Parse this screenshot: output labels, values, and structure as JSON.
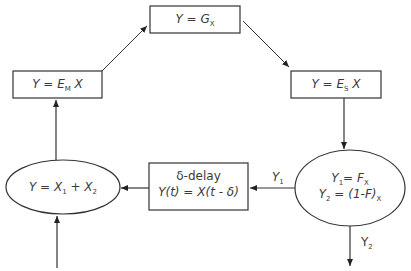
{
  "diagram": {
    "nodes": {
      "top_box": {
        "shape": "rectangle",
        "label": "Y = G",
        "sub": "X"
      },
      "left_box": {
        "shape": "rectangle",
        "label": "Y = E",
        "sub": "M",
        "suffix": " X"
      },
      "right_box": {
        "shape": "rectangle",
        "label": "Y = E",
        "sub": "S",
        "suffix": " X"
      },
      "split_ellipse": {
        "shape": "ellipse",
        "line1": "Y",
        "line1_sub": "1",
        "line1_rest": "= F",
        "line1_sub2": "X",
        "line2": "Y",
        "line2_sub": "2",
        "line2_rest": " = (1-F)",
        "line2_sub2": "X"
      },
      "delay_box": {
        "shape": "rectangle",
        "line1": "δ-delay",
        "line2": "Y(t) = X(t - δ)"
      },
      "sum_ellipse": {
        "shape": "ellipse",
        "label": "Y = X",
        "sub1": "1",
        "mid": " + X",
        "sub2": "2"
      }
    },
    "edge_labels": {
      "y1": {
        "text": "Y",
        "sub": "1"
      },
      "y2": {
        "text": "Y",
        "sub": "2"
      }
    },
    "edges": [
      {
        "from": "input",
        "to": "sum_ellipse"
      },
      {
        "from": "sum_ellipse",
        "to": "left_box"
      },
      {
        "from": "left_box",
        "to": "top_box"
      },
      {
        "from": "top_box",
        "to": "right_box"
      },
      {
        "from": "right_box",
        "to": "split_ellipse"
      },
      {
        "from": "split_ellipse",
        "to": "delay_box",
        "label": "Y1"
      },
      {
        "from": "delay_box",
        "to": "sum_ellipse"
      },
      {
        "from": "split_ellipse",
        "to": "output",
        "label": "Y2"
      }
    ],
    "colors": {
      "stroke": "#333333",
      "background": "#ffffff"
    }
  }
}
